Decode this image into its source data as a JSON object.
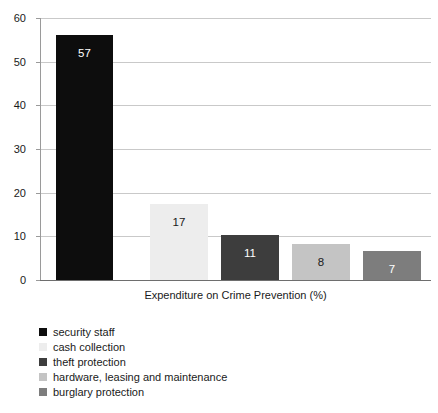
{
  "chart_data": {
    "type": "bar",
    "title": "",
    "subtitle": "",
    "xlabel": "Expenditure on Crime Prevention (%)",
    "ylabel": "",
    "ylim": [
      0,
      60
    ],
    "yticks": [
      0,
      10,
      20,
      30,
      40,
      50,
      60
    ],
    "ytick_labels": [
      "0",
      "10",
      "20",
      "30",
      "40",
      "50",
      "60"
    ],
    "grid": "horizontal",
    "legend_position": "below-left",
    "categories": [
      "security staff",
      "cash collection",
      "theft protection",
      "hardware, leasing and maintenance",
      "burglary protection"
    ],
    "values": [
      57,
      17,
      11,
      8,
      7
    ],
    "value_labels": [
      "57",
      "17",
      "11",
      "8",
      "7"
    ],
    "colors": [
      "#0d0d0d",
      "#ededed",
      "#3d3d3d",
      "#c4c4c4",
      "#7d7d7d"
    ],
    "label_colors": [
      "#ffffff",
      "#1a1a1a",
      "#ffffff",
      "#1a1a1a",
      "#ffffff"
    ],
    "bars": [
      {
        "label": "security staff",
        "value": 57,
        "value_label": "57",
        "color": "#0d0d0d",
        "label_color": "#ffffff",
        "x": 16,
        "width": 57,
        "drawn_value": 56
      },
      {
        "label": "cash collection",
        "value": 17,
        "value_label": "17",
        "color": "#ededed",
        "label_color": "#1a1a1a",
        "x": 110,
        "width": 58,
        "drawn_value": 17.5
      },
      {
        "label": "theft protection",
        "value": 11,
        "value_label": "11",
        "color": "#3d3d3d",
        "label_color": "#ffffff",
        "x": 181,
        "width": 58,
        "drawn_value": 10.2
      },
      {
        "label": "hardware, leasing and maintenance",
        "value": 8,
        "value_label": "8",
        "color": "#c4c4c4",
        "label_color": "#1a1a1a",
        "x": 252,
        "width": 58,
        "drawn_value": 8.2
      },
      {
        "label": "burglary protection",
        "value": 7,
        "value_label": "7",
        "color": "#7d7d7d",
        "label_color": "#ffffff",
        "x": 323,
        "width": 58,
        "drawn_value": 6.6
      }
    ]
  },
  "legend": {
    "items": [
      {
        "label": "security staff",
        "color": "#0d0d0d"
      },
      {
        "label": "cash collection",
        "color": "#ededed"
      },
      {
        "label": "theft protection",
        "color": "#3d3d3d"
      },
      {
        "label": "hardware, leasing and maintenance",
        "color": "#c4c4c4"
      },
      {
        "label": "burglary protection",
        "color": "#7d7d7d"
      }
    ]
  },
  "style": {
    "background": "#ffffff",
    "gridline_color": "#c9c9c9",
    "axis_color": "#6e6e6e",
    "text_color": "#1a1a1a"
  }
}
